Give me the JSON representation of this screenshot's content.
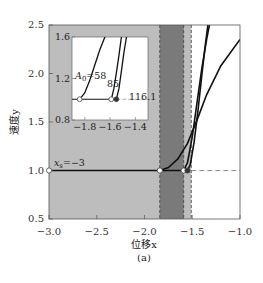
{
  "figure": {
    "caption": "(a)",
    "xlabel": "位移x",
    "ylabel": "速度y"
  },
  "chart_data": {
    "type": "line",
    "title": "",
    "caption": "(a)",
    "xlabel": "位移x",
    "ylabel": "速度y",
    "xlim": [
      -3.0,
      -1.0
    ],
    "ylim": [
      0.5,
      2.5
    ],
    "xticks": [
      "-3.0",
      "-2.5",
      "-2.0",
      "-1.5",
      "-1.0"
    ],
    "yticks": [
      "0.5",
      "1.0",
      "1.5",
      "2.0",
      "2.5"
    ],
    "grid": false,
    "shaded_regions": [
      {
        "name": "light-gray region",
        "x_range": [
          -3.0,
          -1.51
        ],
        "color": "#bdbdbd"
      },
      {
        "name": "dark-gray band",
        "x_range": [
          -1.84,
          -1.59
        ],
        "color": "#7a7a7a"
      }
    ],
    "dashed_lines": [
      {
        "orientation": "vertical",
        "x": -1.84
      },
      {
        "orientation": "vertical",
        "x": -1.59
      },
      {
        "orientation": "vertical",
        "x": -1.51
      },
      {
        "orientation": "horizontal",
        "y": 1.0,
        "x_range": [
          -1.51,
          -1.0
        ]
      }
    ],
    "annotations": [
      {
        "text": "x_s=-3",
        "x": -3.0,
        "y": 1.0
      }
    ],
    "series": [
      {
        "name": "baseline",
        "x": [
          -3.0,
          -1.55
        ],
        "y": [
          1.0,
          1.0
        ]
      },
      {
        "name": "A0=58",
        "x": [
          -1.84,
          -1.75,
          -1.65,
          -1.55,
          -1.45,
          -1.35,
          -1.2,
          -1.0
        ],
        "y": [
          1.0,
          1.03,
          1.12,
          1.28,
          1.52,
          1.78,
          2.08,
          2.35
        ]
      },
      {
        "name": "A0=85",
        "x": [
          -1.59,
          -1.55,
          -1.5,
          -1.45,
          -1.4,
          -1.35,
          -1.3
        ],
        "y": [
          1.0,
          1.08,
          1.35,
          1.7,
          2.05,
          2.35,
          2.6
        ]
      },
      {
        "name": "A0=116.1",
        "x": [
          -1.55,
          -1.52,
          -1.48,
          -1.44,
          -1.4,
          -1.36,
          -1.32
        ],
        "y": [
          1.0,
          1.06,
          1.3,
          1.62,
          1.98,
          2.32,
          2.62
        ]
      }
    ],
    "markers": [
      {
        "x": -3.0,
        "y": 1.0,
        "style": "open"
      },
      {
        "x": -1.84,
        "y": 1.0,
        "style": "open"
      },
      {
        "x": -1.59,
        "y": 1.0,
        "style": "open"
      },
      {
        "x": -1.55,
        "y": 1.0,
        "style": "filled"
      }
    ],
    "inset": {
      "xlim": [
        -1.9,
        -1.3
      ],
      "ylim": [
        0.8,
        1.6
      ],
      "xticks": [
        "-1.8",
        "-1.6",
        "-1.4"
      ],
      "yticks": [
        "0.8",
        "1.2",
        "1.6"
      ],
      "labels": [
        "A_0=58",
        "85",
        "116.1"
      ],
      "series": [
        {
          "name": "A0=58",
          "x": [
            -1.84,
            -1.8,
            -1.76,
            -1.72,
            -1.68,
            -1.64
          ],
          "y": [
            1.0,
            1.06,
            1.18,
            1.33,
            1.48,
            1.6
          ]
        },
        {
          "name": "A0=85",
          "x": [
            -1.59,
            -1.57,
            -1.55,
            -1.53,
            -1.51
          ],
          "y": [
            1.0,
            1.1,
            1.25,
            1.42,
            1.6
          ]
        },
        {
          "name": "A0=116.1",
          "x": [
            -1.55,
            -1.53,
            -1.51,
            -1.49,
            -1.47
          ],
          "y": [
            1.0,
            1.1,
            1.27,
            1.45,
            1.6
          ]
        }
      ]
    }
  }
}
